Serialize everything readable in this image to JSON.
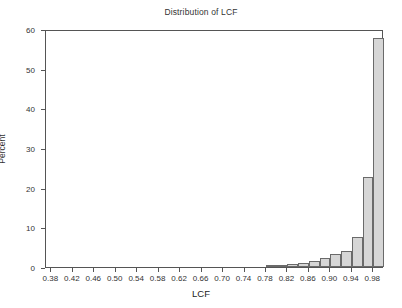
{
  "chart_data": {
    "type": "bar",
    "title": "Distribution of LCF",
    "xlabel": "LCF",
    "ylabel": "Percent",
    "xlim": [
      0.37,
      1.0
    ],
    "ylim": [
      0,
      60
    ],
    "grid": false,
    "legend": null,
    "bin_width": 0.02,
    "xticks": [
      0.38,
      0.42,
      0.46,
      0.5,
      0.54,
      0.58,
      0.62,
      0.66,
      0.7,
      0.74,
      0.78,
      0.82,
      0.86,
      0.9,
      0.94,
      0.98
    ],
    "xtick_labels": [
      "0.38",
      "0.42",
      "0.46",
      "0.50",
      "0.54",
      "0.58",
      "0.62",
      "0.66",
      "0.70",
      "0.74",
      "0.78",
      "0.82",
      "0.86",
      "0.90",
      "0.94",
      "0.98"
    ],
    "yticks": [
      0,
      10,
      20,
      30,
      40,
      50,
      60
    ],
    "ytick_labels": [
      "0",
      "10",
      "20",
      "30",
      "40",
      "50",
      "60"
    ],
    "bar_color": "#d6d6d6",
    "bar_edge_color": "#6a6a6a",
    "bins": [
      {
        "left": 0.78,
        "right": 0.8,
        "value": 0.3
      },
      {
        "left": 0.8,
        "right": 0.82,
        "value": 0.5
      },
      {
        "left": 0.82,
        "right": 0.84,
        "value": 0.8
      },
      {
        "left": 0.84,
        "right": 0.86,
        "value": 1.0
      },
      {
        "left": 0.86,
        "right": 0.88,
        "value": 1.6
      },
      {
        "left": 0.88,
        "right": 0.9,
        "value": 2.3
      },
      {
        "left": 0.9,
        "right": 0.92,
        "value": 3.3
      },
      {
        "left": 0.92,
        "right": 0.94,
        "value": 4.0
      },
      {
        "left": 0.94,
        "right": 0.96,
        "value": 7.6
      },
      {
        "left": 0.96,
        "right": 0.98,
        "value": 22.7
      },
      {
        "left": 0.98,
        "right": 1.0,
        "value": 57.7
      }
    ],
    "categories": [
      "0.79",
      "0.81",
      "0.83",
      "0.85",
      "0.87",
      "0.89",
      "0.91",
      "0.93",
      "0.95",
      "0.97",
      "0.99"
    ],
    "values": [
      0.3,
      0.5,
      0.8,
      1.0,
      1.6,
      2.3,
      3.3,
      4.0,
      7.6,
      22.7,
      57.7
    ]
  }
}
